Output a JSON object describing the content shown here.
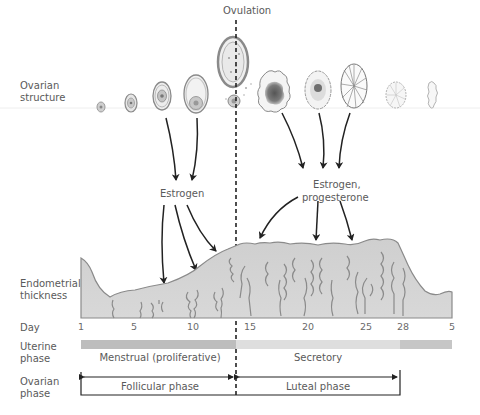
{
  "title_marker": "Ovulation",
  "row_labels": {
    "ovarian_structure": [
      "Ovarian",
      "structure"
    ],
    "endometrial_thickness": [
      "Endometrial",
      "thickness"
    ],
    "day": "Day",
    "uterine_phase": [
      "Uterine",
      "phase"
    ],
    "ovarian_phase": [
      "Ovarian",
      "phase"
    ]
  },
  "hormones": {
    "follicular": "Estrogen",
    "luteal": [
      "Estrogen,",
      "progesterone"
    ]
  },
  "day_ticks": [
    {
      "label": "1",
      "x": 81
    },
    {
      "label": "5",
      "x": 134
    },
    {
      "label": "10",
      "x": 193
    },
    {
      "label": "15",
      "x": 249
    },
    {
      "label": "20",
      "x": 308
    },
    {
      "label": "25",
      "x": 366
    },
    {
      "label": "28",
      "x": 403
    },
    {
      "label": "5",
      "x": 452
    }
  ],
  "uterine_phases": {
    "menstrual": "Menstrual (proliferative)",
    "secretory": "Secretory"
  },
  "ovarian_phases": {
    "follicular": "Follicular phase",
    "luteal": "Luteal phase"
  },
  "colors": {
    "menstrual_bar": "#bdbdbd",
    "secretory_bar": "#dedede",
    "next_cycle_bar": "#c6c6c6",
    "endometrium_fill": "#cfcfcf",
    "endometrium_edge": "#8a8a8a",
    "arrow": "#222222",
    "corpus_luteum_core": "#6e6e6e"
  },
  "ovarian_structures": [
    "primordial-follicle",
    "primary-follicle",
    "secondary-follicle",
    "antral-follicle",
    "graafian-follicle-ovulating",
    "early-corpus-luteum",
    "corpus-luteum",
    "mature-corpus-luteum",
    "regressing-corpus-luteum",
    "corpus-albicans"
  ]
}
